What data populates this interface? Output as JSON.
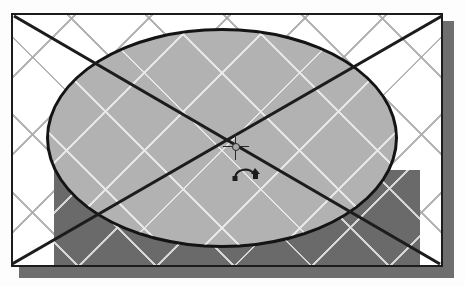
{
  "app": {
    "title": "Drawing Canvas",
    "mode_label": "Rotate"
  },
  "canvas": {
    "name": "drawing-page",
    "background_color": "#ffffff",
    "border_color": "#1c1c1c",
    "shadow_color": "#6e6e6e",
    "grid": {
      "visible": true,
      "style": "diagonal",
      "spacing_px": 55,
      "line_color_on_light": "#a8a8a8",
      "line_color_on_dark": "#e1e1e1"
    }
  },
  "objects": [
    {
      "name": "background-rectangle",
      "type": "rectangle",
      "fill_color": "#6a6a6a",
      "selected": false,
      "x": 41,
      "y": 155,
      "width": 366,
      "height": 99
    },
    {
      "name": "selected-ellipse",
      "type": "ellipse",
      "fill_color": "#b2b2b2",
      "stroke_color": "#141414",
      "stroke_width": 3,
      "selected": true,
      "x": 33,
      "y": 13,
      "width": 352,
      "height": 220
    }
  ],
  "selection": {
    "name": "selection-cross",
    "visible": true,
    "line_color": "#1c1c1c",
    "line_width": 2,
    "handles_visible": false,
    "diagonals": [
      {
        "x1": 0,
        "y1": 0,
        "x2": 432,
        "y2": 254
      },
      {
        "x1": 432,
        "y1": 0,
        "x2": 0,
        "y2": 254
      }
    ]
  },
  "rotation_center": {
    "name": "rotation-center-marker",
    "label": "Rotation center",
    "x": 223,
    "y": 132,
    "marker_color": "#2a2a2a"
  },
  "cursor": {
    "name": "rotate-cursor",
    "label": "Rotate",
    "x": 218,
    "y": 146,
    "color": "#1c1c1c"
  }
}
